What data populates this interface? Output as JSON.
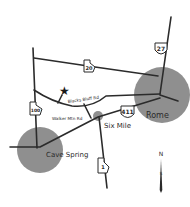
{
  "map": {
    "cities": [
      {
        "name": "Rome",
        "cx": 162,
        "cy": 95,
        "r": 28
      },
      {
        "name": "Cave Spring",
        "cx": 40,
        "cy": 150,
        "r": 23
      },
      {
        "name": "Six Mile",
        "cx": 98,
        "cy": 116,
        "r": 6
      }
    ],
    "roads": [
      {
        "name": "Blacks Bluff Rd"
      },
      {
        "name": "Walker Mtn Rd"
      }
    ],
    "highways": [
      {
        "number": "27",
        "type": "us"
      },
      {
        "number": "20",
        "type": "state"
      },
      {
        "number": "100",
        "type": "state"
      },
      {
        "number": "411",
        "type": "us"
      },
      {
        "number": "1",
        "type": "state"
      }
    ],
    "compass": {
      "north": "N",
      "south": "S"
    },
    "colors": {
      "city_fill": "#8f8f8f",
      "road": "#2b2b2b",
      "background": "#ffffff"
    }
  }
}
